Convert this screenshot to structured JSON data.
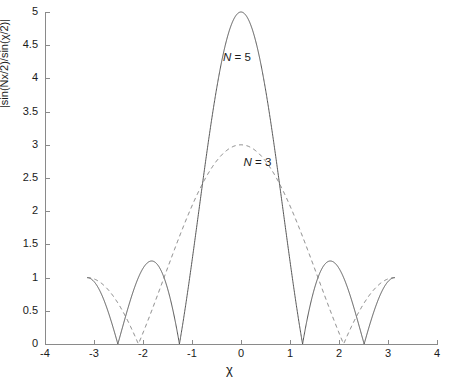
{
  "chart_data": {
    "type": "line",
    "title": "",
    "xlabel": "χ",
    "ylabel": "|sin(Nx/2)/sin(χ/2)|",
    "xlim": [
      -4,
      4
    ],
    "ylim": [
      0,
      5
    ],
    "xticks": [
      -4,
      -3,
      -2,
      -1,
      0,
      1,
      2,
      3,
      4
    ],
    "xticklabels": [
      "-4",
      "-3",
      "-2",
      "-1",
      "0",
      "1",
      "2",
      "3",
      "4"
    ],
    "yticks": [
      0,
      0.5,
      1,
      1.5,
      2,
      2.5,
      3,
      3.5,
      4,
      4.5,
      5
    ],
    "yticklabels": [
      "0",
      "0.5",
      "1",
      "1.5",
      "2",
      "2.5",
      "3",
      "3.5",
      "4",
      "4.5",
      "5"
    ],
    "grid": false,
    "legend": "inline-annotations",
    "series": [
      {
        "name": "N = 5",
        "label_text": "N = 5",
        "linestyle": "solid",
        "color": "#555555",
        "peak_value": 5,
        "peak_x": 0,
        "zeros": [
          -2.513,
          -1.257,
          1.257,
          2.513
        ],
        "sidelobe_peaks": [
          {
            "x": -1.885,
            "y": 1.236
          },
          {
            "x": 1.885,
            "y": 1.236
          }
        ],
        "endpoint_values": [
          {
            "x": -3.1416,
            "y": 1.0
          },
          {
            "x": 3.1416,
            "y": 1.0
          }
        ]
      },
      {
        "name": "N = 3",
        "label_text": "N = 3",
        "linestyle": "dashed",
        "color": "#7a7a7a",
        "peak_value": 3,
        "peak_x": 0,
        "zeros": [
          -2.0944,
          2.0944
        ],
        "sidelobe_peaks": [
          {
            "x": -2.618,
            "y": 1.0
          },
          {
            "x": 2.618,
            "y": 1.0
          }
        ],
        "endpoint_values": [
          {
            "x": -3.1416,
            "y": 1.0
          },
          {
            "x": 3.1416,
            "y": 1.0
          }
        ]
      }
    ],
    "annotations": [
      {
        "text": "N = 5",
        "x": 0.0,
        "y": 4.3
      },
      {
        "text": "N = 3",
        "x": 0.42,
        "y": 2.72
      }
    ]
  },
  "axis": {
    "y_label": "|sin(Nx/2)/sin(χ/2)|",
    "x_label": "χ"
  },
  "annotations": {
    "n5": {
      "n": "N",
      "eq": " = ",
      "value": "5"
    },
    "n3": {
      "n": "N",
      "eq": " = ",
      "value": "3"
    }
  }
}
